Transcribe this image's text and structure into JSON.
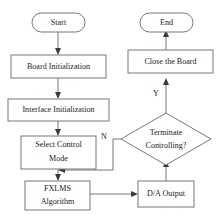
{
  "diagram": {
    "colors": {
      "shape_stroke": "#777777",
      "shape_fill": "#ffffff",
      "connector": "#777777",
      "arrowhead": "#3a3a3a",
      "text": "#1a1a1a",
      "background": "#ffffff"
    },
    "nodes": {
      "start": {
        "label": "Start",
        "shape": "terminator"
      },
      "end": {
        "label": "End",
        "shape": "terminator"
      },
      "board_init": {
        "label": "Board Initialization",
        "shape": "process"
      },
      "interface_init": {
        "label": "Interface Initialization",
        "shape": "process"
      },
      "select_control_mode": {
        "label_line1": "Select Control",
        "label_line2": "Mode",
        "shape": "process"
      },
      "fxlms": {
        "label_line1": "FXLMS",
        "label_line2": "Algorithm",
        "shape": "process"
      },
      "da_output": {
        "label": "D/A Output",
        "shape": "process"
      },
      "terminate_decision": {
        "label_line1": "Terminate",
        "label_line2": "Controlling?",
        "shape": "decision"
      },
      "close_board": {
        "label": "Close the Board",
        "shape": "process"
      }
    },
    "edge_labels": {
      "yes": "Y",
      "no": "N"
    }
  }
}
